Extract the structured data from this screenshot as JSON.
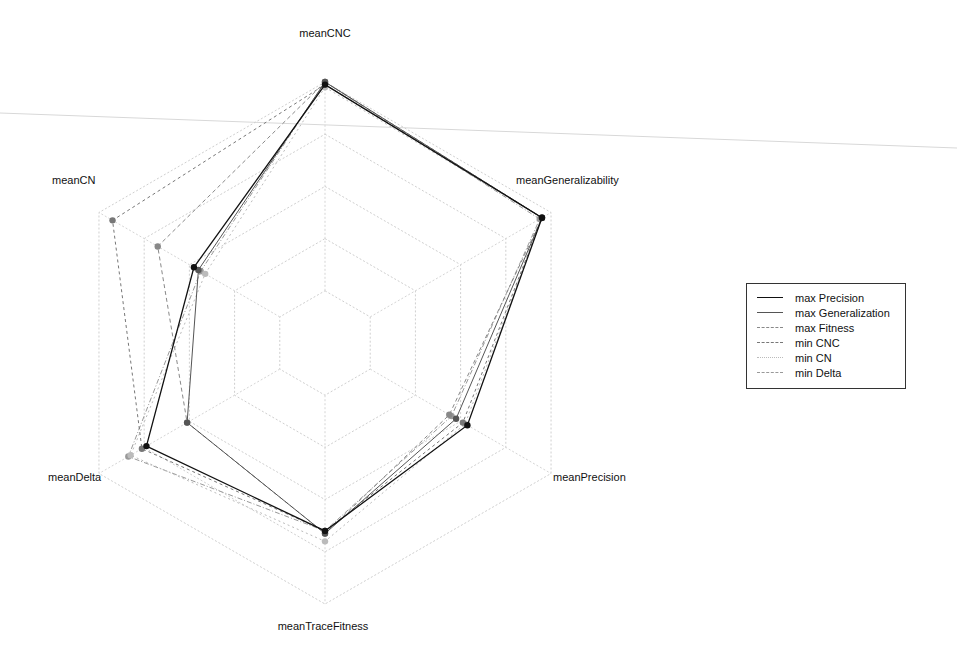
{
  "chart_data": {
    "type": "radar",
    "title": "",
    "axes": [
      "meanCNC",
      "meanGeneralizability",
      "meanPrecision",
      "meanTraceFitness",
      "meanDelta",
      "meanCN"
    ],
    "grid_levels": [
      0.2,
      0.4,
      0.6,
      0.8,
      1.0
    ],
    "range": [
      0,
      1
    ],
    "legend_position": "right",
    "series": [
      {
        "name": "max Precision",
        "color": "#111111",
        "dash": "",
        "width": 1.3,
        "values": [
          0.99,
          0.96,
          0.63,
          0.72,
          0.79,
          0.58
        ]
      },
      {
        "name": "max Generalization",
        "color": "#555555",
        "dash": "",
        "width": 1,
        "values": [
          1.0,
          0.96,
          0.58,
          0.73,
          0.61,
          0.56
        ]
      },
      {
        "name": "max Fitness",
        "color": "#888888",
        "dash": "4,3",
        "width": 1,
        "values": [
          1.0,
          0.96,
          0.55,
          0.73,
          0.61,
          0.74
        ]
      },
      {
        "name": "min CNC",
        "color": "#777777",
        "dash": "3,3",
        "width": 1,
        "values": [
          0.99,
          0.96,
          0.61,
          0.72,
          0.81,
          0.94
        ]
      },
      {
        "name": "min CN",
        "color": "#bbbbbb",
        "dash": "2,3",
        "width": 1,
        "values": [
          0.98,
          0.96,
          0.62,
          0.76,
          0.86,
          0.53
        ]
      },
      {
        "name": "min Delta",
        "color": "#999999",
        "dash": "5,2,1,2",
        "width": 1,
        "values": [
          1.0,
          0.95,
          0.56,
          0.72,
          0.87,
          0.55
        ]
      }
    ]
  },
  "axis_labels": {
    "meanCNC": "meanCNC",
    "meanGeneralizability": "meanGeneralizability",
    "meanPrecision": "meanPrecision",
    "meanTraceFitness": "meanTraceFitness",
    "meanDelta": "meanDelta",
    "meanCN": "meanCN"
  },
  "legend": {
    "items": [
      {
        "label": "max Precision",
        "color": "#111111",
        "style": "solid"
      },
      {
        "label": "max Generalization",
        "color": "#555555",
        "style": "solid"
      },
      {
        "label": "max Fitness",
        "color": "#888888",
        "style": "dashed"
      },
      {
        "label": "min CNC",
        "color": "#777777",
        "style": "dashed"
      },
      {
        "label": "min CN",
        "color": "#bbbbbb",
        "style": "dotted"
      },
      {
        "label": "min Delta",
        "color": "#999999",
        "style": "dashed"
      }
    ]
  }
}
